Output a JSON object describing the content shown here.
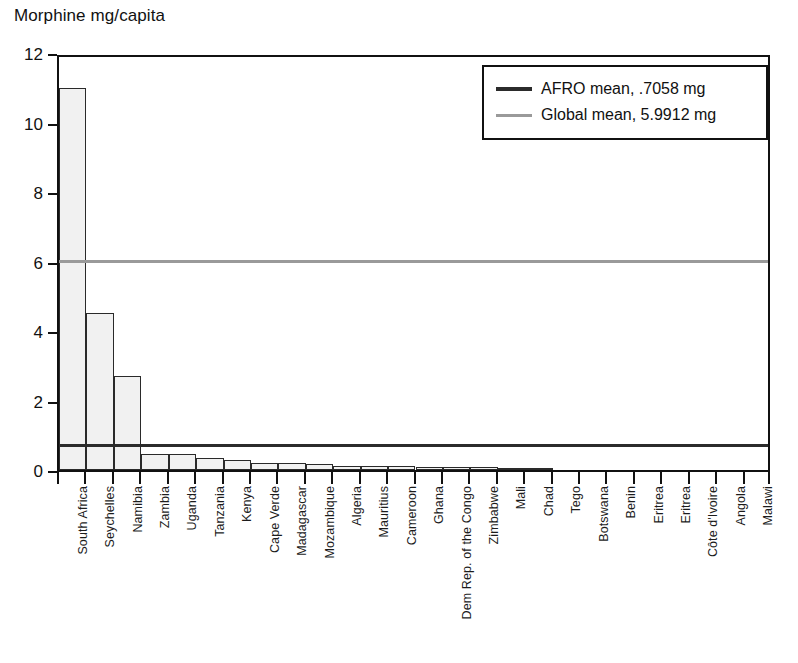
{
  "chart_data": {
    "type": "bar",
    "title": "Morphine mg/capita",
    "xlabel": "",
    "ylabel": "Morphine mg/capita",
    "ylim": [
      0,
      12
    ],
    "yticks": [
      0,
      2,
      4,
      6,
      8,
      10,
      12
    ],
    "grid": false,
    "legend_position": "top-right",
    "categories": [
      "South Africa",
      "Seychelles",
      "Namibia",
      "Zambia",
      "Uganda",
      "Tanzania",
      "Kenya",
      "Cape Verde",
      "Madagascar",
      "Mozambique",
      "Algeria",
      "Mauritius",
      "Cameroon",
      "Ghana",
      "Dem Rep. of the Congo",
      "Zimbabwe",
      "Mali",
      "Chad",
      "Tego",
      "Botswana",
      "Benin",
      "Eritrea",
      "Eritrea",
      "Côte d'Ivoire",
      "Angola",
      "Malawi"
    ],
    "values": [
      11.0,
      4.52,
      2.7,
      0.47,
      0.47,
      0.36,
      0.3,
      0.19,
      0.19,
      0.16,
      0.12,
      0.12,
      0.12,
      0.09,
      0.09,
      0.09,
      0.06,
      0.06,
      0.0,
      0.0,
      0.0,
      0.0,
      0.0,
      0.0,
      0.0,
      0.0
    ],
    "reference_lines": [
      {
        "name": "AFRO mean",
        "value": 0.7058,
        "label": "AFRO mean, .7058 mg",
        "color": "#2b2b2b"
      },
      {
        "name": "Global mean",
        "value": 5.9912,
        "label": "Global mean, 5.9912 mg",
        "color": "#9a9a9a"
      }
    ]
  },
  "legend": {
    "items": [
      {
        "label": "AFRO mean, .7058 mg"
      },
      {
        "label": "Global mean, 5.9912 mg"
      }
    ]
  }
}
